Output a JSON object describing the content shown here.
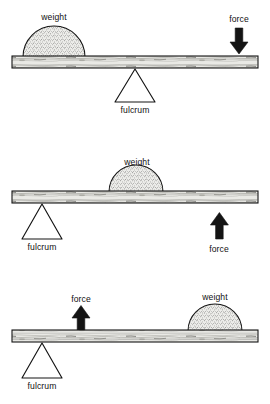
{
  "figure": {
    "background_color": "#ffffff",
    "ink_color": "#111111",
    "beam_fill": "#e8e8e4",
    "weight_fill": "#e2e2de",
    "arrow_fill": "#141414",
    "fulcrum_fill": "#ffffff",
    "width": 270,
    "height": 404
  },
  "diagrams": [
    {
      "id": "lever-class-1",
      "labels": {
        "weight": "weight",
        "force": "force",
        "fulcrum": "fulcrum"
      },
      "weight_position": "left",
      "force_position": "right",
      "force_direction": "down",
      "fulcrum_position": "center"
    },
    {
      "id": "lever-class-2",
      "labels": {
        "weight": "weight",
        "force": "force",
        "fulcrum": "fulcrum"
      },
      "weight_position": "center",
      "force_position": "right",
      "force_direction": "up",
      "fulcrum_position": "left"
    },
    {
      "id": "lever-class-3",
      "labels": {
        "weight": "weight",
        "force": "force",
        "fulcrum": "fulcrum"
      },
      "weight_position": "right",
      "force_position": "left-center",
      "force_direction": "up",
      "fulcrum_position": "left"
    }
  ]
}
